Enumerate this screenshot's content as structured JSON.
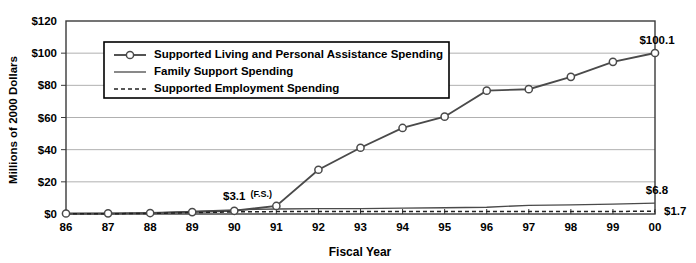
{
  "chart_data": {
    "type": "line",
    "title": "",
    "xlabel": "Fiscal Year",
    "ylabel": "Millions of 2000 Dollars",
    "categories": [
      "86",
      "87",
      "88",
      "89",
      "90",
      "91",
      "92",
      "93",
      "94",
      "95",
      "96",
      "97",
      "98",
      "99",
      "00"
    ],
    "ylim": [
      0,
      120
    ],
    "yticks": [
      "$0",
      "$20",
      "$40",
      "$60",
      "$80",
      "$100",
      "$120"
    ],
    "ytick_values": [
      0,
      20,
      40,
      60,
      80,
      100,
      120
    ],
    "grid": true,
    "legend_position": "upper-left-inside",
    "series": [
      {
        "name": "Supported Living and Personal Assistance Spending",
        "marker": "open-circle",
        "style": "solid",
        "values": [
          0.3,
          0.4,
          0.6,
          1.2,
          2.0,
          5.0,
          27.5,
          41.2,
          53.5,
          60.5,
          76.7,
          77.6,
          85.3,
          94.6,
          100.1
        ]
      },
      {
        "name": "Family Support Spending",
        "marker": "none",
        "style": "solid",
        "values": [
          0.2,
          0.3,
          0.5,
          1.6,
          2.6,
          3.1,
          3.3,
          3.4,
          3.6,
          3.9,
          4.2,
          5.4,
          5.7,
          6.2,
          6.8
        ]
      },
      {
        "name": "Supported Employment Spending",
        "marker": "none",
        "style": "dashed",
        "values": [
          0.1,
          0.2,
          0.3,
          0.9,
          1.3,
          1.5,
          1.5,
          1.5,
          1.5,
          1.5,
          1.5,
          1.6,
          1.6,
          1.6,
          1.7
        ]
      }
    ],
    "annotations": [
      {
        "text": "$3.1",
        "sub": "(F.S.)",
        "x_category": "90",
        "value": 3.1,
        "position": "above"
      },
      {
        "text": "$100.1",
        "sub": "",
        "x_category": "00",
        "value": 100.1,
        "position": "above-right"
      },
      {
        "text": "$6.8",
        "sub": "",
        "x_category": "00",
        "value": 6.8,
        "position": "above-right"
      },
      {
        "text": "$1.7",
        "sub": "",
        "x_category": "00",
        "value": 1.7,
        "position": "right"
      }
    ]
  },
  "legend": {
    "items": [
      {
        "label": "Supported Living and Personal Assistance Spending"
      },
      {
        "label": "Family Support Spending"
      },
      {
        "label": "Supported Employment Spending"
      }
    ]
  },
  "axes": {
    "y_title": "Millions of 2000 Dollars",
    "x_title": "Fiscal Year"
  }
}
